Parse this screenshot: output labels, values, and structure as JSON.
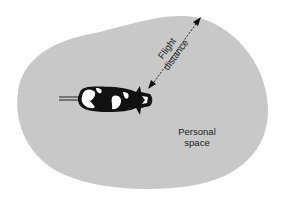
{
  "diagram": {
    "labels": {
      "flight_line1": "Flight",
      "flight_line2": "distance",
      "personal_line1": "Personal",
      "personal_line2": "space"
    },
    "colors": {
      "zone_fill": "#c8c8c8",
      "background": "#ffffff",
      "ink": "#111111"
    }
  }
}
